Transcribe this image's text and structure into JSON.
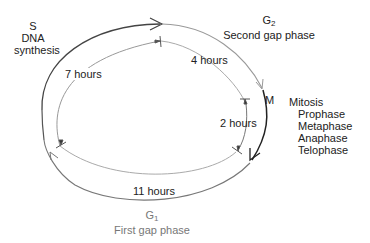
{
  "diagram": {
    "phases": {
      "S": {
        "letter": "S",
        "name": "DNA",
        "name2": "synthesis",
        "duration": "7 hours"
      },
      "G2": {
        "letter": "G",
        "sub": "2",
        "name": "Second gap phase",
        "duration": "4 hours"
      },
      "M": {
        "letter": "M",
        "name": "Mitosis",
        "duration": "2 hours",
        "subphases": [
          "Prophase",
          "Metaphase",
          "Anaphase",
          "Telophase"
        ]
      },
      "G1": {
        "letter": "G",
        "sub": "1",
        "name": "First gap phase",
        "duration": "11 hours"
      }
    },
    "colors": {
      "outer_dark": "#333333",
      "outer_mid": "#666666",
      "inner": "#999999",
      "text": "#222222",
      "g1_text": "#777777"
    }
  }
}
